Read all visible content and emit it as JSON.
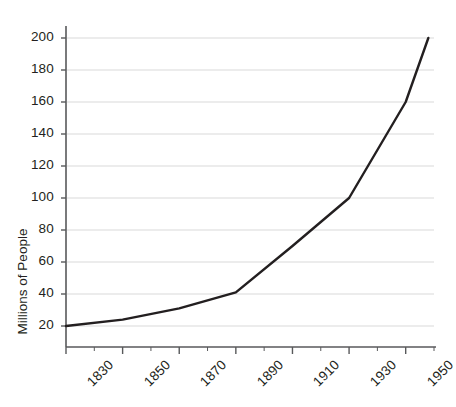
{
  "chart_data": {
    "type": "line",
    "title": "",
    "xlabel": "",
    "ylabel": "Millions of People",
    "xlim": [
      1830,
      1960
    ],
    "ylim": [
      0,
      210
    ],
    "grid": true,
    "legend": "none",
    "x_major_ticks": [
      1830,
      1850,
      1870,
      1890,
      1910,
      1930,
      1950
    ],
    "x_minor_ticks": [
      1840,
      1860,
      1880,
      1900,
      1920,
      1940,
      1960
    ],
    "x_tick_labels": [
      "1830",
      "1850",
      "1870",
      "1890",
      "1910",
      "1930",
      "1950"
    ],
    "y_ticks": [
      20,
      40,
      60,
      80,
      100,
      120,
      140,
      160,
      180,
      200
    ],
    "y_tick_labels": [
      "20",
      "40",
      "60",
      "80",
      "100",
      "120",
      "140",
      "160",
      "180",
      "200"
    ],
    "series": [
      {
        "name": "Population",
        "color": "#231f20",
        "x": [
          1830,
          1850,
          1870,
          1890,
          1910,
          1930,
          1950,
          1958
        ],
        "values": [
          20,
          24,
          31,
          41,
          70,
          100,
          160,
          200
        ]
      }
    ],
    "colors": {
      "line": "#231f20",
      "grid": "#d9d9d9",
      "axis": "#58595b",
      "text": "#231f20",
      "background": "#ffffff"
    }
  }
}
